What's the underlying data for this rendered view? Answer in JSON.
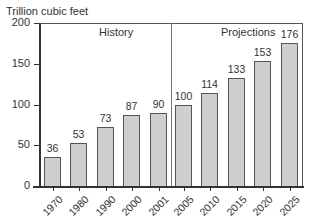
{
  "chart_data": {
    "type": "bar",
    "title": "",
    "ylabel": "Trillion cubic feet",
    "xlabel": "",
    "ylim": [
      0,
      200
    ],
    "yticks": [
      0,
      50,
      100,
      150,
      200
    ],
    "grid": false,
    "categories": [
      "1970",
      "1980",
      "1990",
      "2000",
      "2001",
      "2005",
      "2010",
      "2015",
      "2020",
      "2025"
    ],
    "values": [
      36,
      53,
      73,
      87,
      90,
      100,
      114,
      133,
      153,
      176
    ],
    "regions": [
      {
        "label": "History",
        "categories": [
          "1970",
          "1980",
          "1990",
          "2000",
          "2001"
        ]
      },
      {
        "label": "Projections",
        "categories": [
          "2005",
          "2010",
          "2015",
          "2020",
          "2025"
        ]
      }
    ],
    "bar_color": "#cfcfcf",
    "bar_edge_color": "#555555"
  },
  "labels": {
    "ylabel": "Trillion cubic feet",
    "history": "History",
    "projections": "Projections"
  }
}
